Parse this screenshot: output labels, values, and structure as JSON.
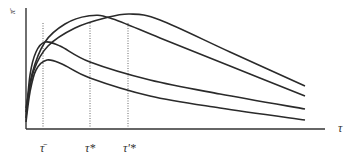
{
  "chart_data": {
    "type": "line",
    "title": "",
    "xlabel": "τ",
    "ylabel": "π̄",
    "grid": false,
    "legend": null,
    "x_ticks": [
      {
        "label": "τ̄",
        "x": 43
      },
      {
        "label": "τ*",
        "x": 90
      },
      {
        "label": "τ'*",
        "x": 128
      }
    ],
    "series": [
      {
        "name": "curve-1",
        "points": [
          [
            26,
            118
          ],
          [
            30,
            75
          ],
          [
            36,
            52
          ],
          [
            45,
            42
          ],
          [
            60,
            46
          ],
          [
            90,
            62
          ],
          [
            150,
            80
          ],
          [
            220,
            94
          ],
          [
            305,
            109
          ]
        ]
      },
      {
        "name": "curve-2",
        "points": [
          [
            26,
            122
          ],
          [
            30,
            92
          ],
          [
            36,
            70
          ],
          [
            47,
            60
          ],
          [
            62,
            64
          ],
          [
            90,
            78
          ],
          [
            150,
            96
          ],
          [
            220,
            108
          ],
          [
            305,
            120
          ]
        ]
      },
      {
        "name": "curve-3",
        "points": [
          [
            26,
            112
          ],
          [
            32,
            74
          ],
          [
            45,
            42
          ],
          [
            65,
            24
          ],
          [
            88,
            16
          ],
          [
            110,
            18
          ],
          [
            160,
            38
          ],
          [
            230,
            66
          ],
          [
            305,
            96
          ]
        ]
      },
      {
        "name": "curve-4",
        "points": [
          [
            26,
            108
          ],
          [
            34,
            70
          ],
          [
            48,
            46
          ],
          [
            75,
            28
          ],
          [
            105,
            18
          ],
          [
            130,
            14
          ],
          [
            160,
            20
          ],
          [
            230,
            52
          ],
          [
            305,
            86
          ]
        ]
      }
    ],
    "axes": {
      "origin": [
        26,
        129
      ],
      "x_end": 325,
      "y_top": 8
    },
    "annotations": [
      "dotted vertical lines at τ̄, τ*, τ'*"
    ]
  },
  "labels": {
    "x_axis": "τ",
    "y_axis": "π̄",
    "tick_tau_bar": "τ̄",
    "tick_tau_star": "τ*",
    "tick_tau_prime_star": "τ'*"
  }
}
